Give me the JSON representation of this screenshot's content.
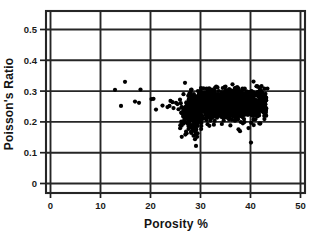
{
  "chart_data": {
    "type": "scatter",
    "title": "",
    "xlabel": "Porosity %",
    "ylabel": "Poisson's Ratio",
    "xlim": [
      0,
      50
    ],
    "ylim": [
      0,
      0.55
    ],
    "xticks": [
      0,
      10,
      20,
      30,
      40,
      50
    ],
    "yticks": [
      0,
      0.1,
      0.2,
      0.3,
      0.4,
      0.5
    ],
    "xtick_labels": [
      "0",
      "10",
      "20",
      "30",
      "40",
      "50"
    ],
    "ytick_labels": [
      "0",
      "0.1",
      "0.2",
      "0.3",
      "0.4",
      "0.5"
    ],
    "grid": true,
    "grid_color": "#262626",
    "legend": "none",
    "marker": "filled-circle",
    "marker_color": "#000000",
    "marker_size": 2.1,
    "point_count_approx": 1500,
    "series": [
      {
        "name": "Poisson's Ratio vs Porosity",
        "color": "#000000",
        "sparse_points": [
          [
            12.9,
            0.304
          ],
          [
            14.1,
            0.252
          ],
          [
            14.9,
            0.33
          ],
          [
            16.9,
            0.266
          ],
          [
            17.7,
            0.262
          ],
          [
            18.0,
            0.305
          ],
          [
            20.2,
            0.274
          ],
          [
            20.6,
            0.275
          ],
          [
            21.1,
            0.24
          ],
          [
            22.4,
            0.253
          ],
          [
            23.4,
            0.248
          ],
          [
            23.8,
            0.252
          ],
          [
            24.0,
            0.268
          ],
          [
            24.4,
            0.264
          ],
          [
            24.6,
            0.245
          ],
          [
            25.1,
            0.262
          ],
          [
            25.4,
            0.258
          ],
          [
            25.6,
            0.241
          ],
          [
            25.9,
            0.272
          ],
          [
            26.2,
            0.247
          ],
          [
            26.4,
            0.228
          ],
          [
            26.6,
            0.29
          ],
          [
            26.9,
            0.327
          ],
          [
            27.2,
            0.214
          ],
          [
            27.4,
            0.196
          ],
          [
            27.6,
            0.177
          ],
          [
            27.9,
            0.181
          ],
          [
            28.1,
            0.168
          ],
          [
            28.4,
            0.19
          ],
          [
            28.6,
            0.155
          ],
          [
            28.9,
            0.144
          ],
          [
            29.1,
            0.122
          ],
          [
            29.4,
            0.163
          ],
          [
            29.6,
            0.205
          ],
          [
            30.1,
            0.31
          ],
          [
            31.2,
            0.308
          ],
          [
            33.4,
            0.312
          ],
          [
            35.0,
            0.315
          ],
          [
            36.4,
            0.322
          ],
          [
            37.6,
            0.176
          ],
          [
            37.9,
            0.17
          ],
          [
            38.4,
            0.308
          ],
          [
            39.6,
            0.18
          ],
          [
            40.1,
            0.133
          ],
          [
            40.6,
            0.331
          ],
          [
            41.3,
            0.316
          ],
          [
            42.2,
            0.3
          ],
          [
            42.7,
            0.283
          ]
        ],
        "cluster": {
          "x_center": 36.0,
          "x_spread": 4.0,
          "x_range": [
            27.0,
            43.2
          ],
          "y_center": 0.258,
          "y_spread": 0.02,
          "y_range": [
            0.205,
            0.305
          ],
          "n": 1400
        }
      }
    ]
  },
  "axes": {
    "x_axis_name": "porosity-axis",
    "y_axis_name": "poissons-ratio-axis"
  }
}
